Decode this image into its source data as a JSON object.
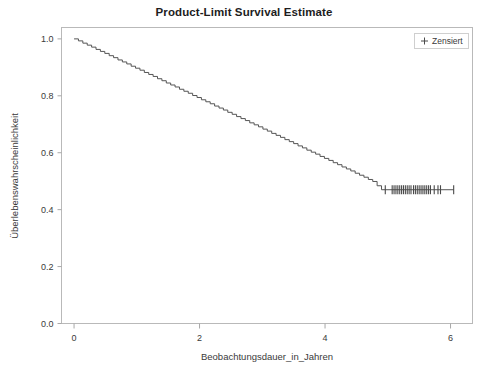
{
  "chart_data": {
    "type": "line",
    "title": "Product-Limit Survival Estimate",
    "xlabel": "Beobachtungsdauer_in_Jahren",
    "ylabel": "Überlebenswahrscheinlichkeit",
    "xlim": [
      -0.2,
      6.35
    ],
    "ylim": [
      0.0,
      1.04
    ],
    "xticks": [
      0,
      2,
      4,
      6
    ],
    "xtick_labels": [
      "0",
      "2",
      "4",
      "6"
    ],
    "yticks": [
      0.0,
      0.2,
      0.4,
      0.6,
      0.8,
      1.0
    ],
    "ytick_labels": [
      "0.0",
      "0.2",
      "0.4",
      "0.6",
      "0.8",
      "1.0"
    ],
    "grid": false,
    "legend_position": "top-right",
    "legend": [
      {
        "label": "Zensiert",
        "marker": "plus"
      }
    ],
    "series": [
      {
        "name": "Survival",
        "type": "step",
        "color": "#555555",
        "x": [
          0.0,
          0.07,
          0.14,
          0.21,
          0.28,
          0.35,
          0.42,
          0.49,
          0.56,
          0.63,
          0.7,
          0.77,
          0.84,
          0.91,
          0.98,
          1.05,
          1.12,
          1.19,
          1.26,
          1.33,
          1.4,
          1.47,
          1.54,
          1.61,
          1.68,
          1.75,
          1.82,
          1.89,
          1.96,
          2.03,
          2.1,
          2.17,
          2.24,
          2.31,
          2.38,
          2.45,
          2.52,
          2.59,
          2.66,
          2.73,
          2.8,
          2.87,
          2.94,
          3.01,
          3.08,
          3.15,
          3.22,
          3.29,
          3.36,
          3.43,
          3.5,
          3.57,
          3.64,
          3.71,
          3.78,
          3.85,
          3.92,
          3.99,
          4.06,
          4.13,
          4.2,
          4.27,
          4.34,
          4.41,
          4.48,
          4.55,
          4.62,
          4.69,
          4.76,
          4.83,
          4.9,
          6.05
        ],
        "y": [
          1.0,
          0.993,
          0.985,
          0.978,
          0.971,
          0.963,
          0.956,
          0.949,
          0.941,
          0.934,
          0.926,
          0.919,
          0.912,
          0.904,
          0.897,
          0.89,
          0.882,
          0.875,
          0.868,
          0.86,
          0.853,
          0.845,
          0.838,
          0.831,
          0.823,
          0.816,
          0.809,
          0.801,
          0.794,
          0.786,
          0.779,
          0.772,
          0.764,
          0.757,
          0.75,
          0.742,
          0.735,
          0.727,
          0.72,
          0.713,
          0.705,
          0.698,
          0.691,
          0.683,
          0.676,
          0.668,
          0.661,
          0.654,
          0.646,
          0.639,
          0.632,
          0.624,
          0.617,
          0.609,
          0.602,
          0.595,
          0.587,
          0.58,
          0.573,
          0.565,
          0.558,
          0.55,
          0.543,
          0.536,
          0.528,
          0.521,
          0.514,
          0.506,
          0.499,
          0.484,
          0.47,
          0.47
        ]
      }
    ],
    "censored_points": {
      "name": "Zensiert",
      "marker": "plus",
      "y": 0.47,
      "x": [
        4.96,
        5.07,
        5.1,
        5.13,
        5.16,
        5.19,
        5.22,
        5.25,
        5.28,
        5.31,
        5.34,
        5.37,
        5.41,
        5.44,
        5.47,
        5.5,
        5.53,
        5.56,
        5.59,
        5.62,
        5.65,
        5.68,
        5.74,
        5.8,
        5.84,
        6.05
      ]
    }
  },
  "colors": {
    "curve": "#555555",
    "frame": "#b9b9b9",
    "text": "#3a3a3a",
    "title": "#1d1d1d",
    "background": "#ffffff"
  }
}
